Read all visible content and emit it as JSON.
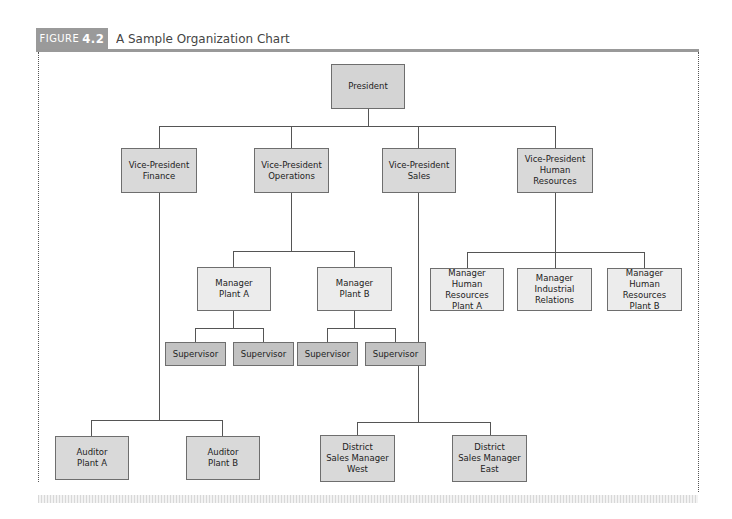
{
  "header": {
    "figure_label": "FIGURE",
    "figure_number": "4.2",
    "title": "A Sample Organization Chart"
  },
  "chart": {
    "president": "President",
    "vice_presidents": [
      {
        "label": "Vice-President\nFinance"
      },
      {
        "label": "Vice-President\nOperations"
      },
      {
        "label": "Vice-President\nSales"
      },
      {
        "label": "Vice-President\nHuman Resources"
      }
    ],
    "operations_managers": [
      {
        "label": "Manager\nPlant A"
      },
      {
        "label": "Manager\nPlant B"
      }
    ],
    "supervisors": [
      {
        "label": "Supervisor"
      },
      {
        "label": "Supervisor"
      },
      {
        "label": "Supervisor"
      },
      {
        "label": "Supervisor"
      }
    ],
    "hr_managers": [
      {
        "label": "Manager\nHuman Resources\nPlant A"
      },
      {
        "label": "Manager\nIndustrial\nRelations"
      },
      {
        "label": "Manager\nHuman Resources\nPlant B"
      }
    ],
    "auditors": [
      {
        "label": "Auditor\nPlant A"
      },
      {
        "label": "Auditor\nPlant B"
      }
    ],
    "district_managers": [
      {
        "label": "District\nSales Manager\nWest"
      },
      {
        "label": "District\nSales Manager\nEast"
      }
    ]
  }
}
